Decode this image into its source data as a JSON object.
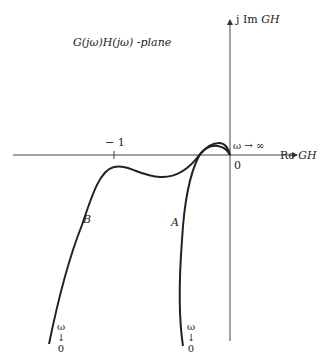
{
  "diagram": {
    "title": "G(jω)H(jω) -plane",
    "axes": {
      "imag_label_prefix": "j Im ",
      "imag_label_var": "GH",
      "real_label_prefix": "Re ",
      "real_label_var": "GH",
      "origin_label": "0",
      "tick_label": "− 1",
      "high_freq_label": "ω → ∞"
    },
    "curves": [
      {
        "name": "A",
        "label": "A",
        "start_label": [
          "ω",
          "↓",
          "0"
        ]
      },
      {
        "name": "B",
        "label": "B",
        "start_label": [
          "ω",
          "↓",
          "0"
        ]
      }
    ],
    "colors": {
      "line": "#222222",
      "axis": "#444444",
      "background": "#ffffff"
    }
  }
}
